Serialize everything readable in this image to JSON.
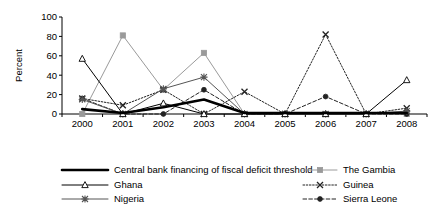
{
  "chart_data": {
    "type": "line",
    "title": "",
    "xlabel": "",
    "ylabel": "Percent",
    "categories": [
      "2000",
      "2001",
      "2002",
      "2003",
      "2004",
      "2005",
      "2006",
      "2007",
      "2008"
    ],
    "ylim": [
      0,
      100
    ],
    "yticks": [
      "0",
      "20",
      "40",
      "60",
      "80",
      "100"
    ],
    "grid": false,
    "legend_position": "bottom",
    "series": [
      {
        "name": "Central bank financing of fiscal deficit threshold",
        "values": [
          5,
          1,
          7,
          15,
          1,
          1,
          1,
          1,
          1
        ],
        "color": "#000000",
        "marker": "none",
        "dash": "solid",
        "width": 2.6
      },
      {
        "name": "Ghana",
        "values": [
          57,
          0,
          11,
          0,
          0,
          0,
          0,
          0,
          35
        ],
        "color": "#000000",
        "marker": "triangle-open",
        "dash": "solid",
        "width": 1
      },
      {
        "name": "Nigeria",
        "values": [
          15,
          0,
          26,
          38,
          0,
          0,
          0,
          0,
          3
        ],
        "color": "#555555",
        "marker": "asterisk",
        "dash": "solid",
        "width": 1
      },
      {
        "name": "The Gambia",
        "values": [
          0,
          81,
          25,
          63,
          0,
          0,
          0,
          0,
          0
        ],
        "color": "#9a9a9a",
        "marker": "square",
        "dash": "solid",
        "width": 1
      },
      {
        "name": "Guinea",
        "values": [
          16,
          9,
          25,
          0,
          23,
          0,
          82,
          0,
          6
        ],
        "color": "#222222",
        "marker": "x",
        "dash": "dotted",
        "width": 1
      },
      {
        "name": "Sierra Leone",
        "values": [
          16,
          0,
          0,
          25,
          0,
          0,
          18,
          0,
          0
        ],
        "color": "#222222",
        "marker": "circle-filled",
        "dash": "dashed",
        "width": 1
      }
    ],
    "annotations": []
  },
  "legend": {
    "entries": [
      {
        "label": "Central bank financing of fiscal deficit threshold"
      },
      {
        "label": "Ghana"
      },
      {
        "label": "Nigeria"
      },
      {
        "label": "The Gambia"
      },
      {
        "label": "Guinea"
      },
      {
        "label": "Sierra Leone"
      }
    ]
  }
}
